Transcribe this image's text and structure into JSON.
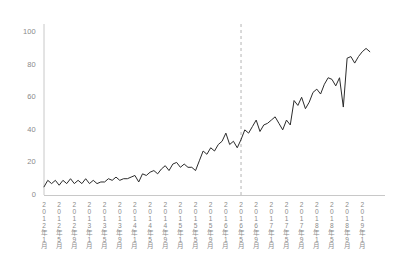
{
  "chart_data": {
    "type": "line",
    "title": "",
    "subtitle": "",
    "xlabel": "",
    "ylabel": "",
    "ylim": [
      0,
      105
    ],
    "yticks": [
      0,
      20,
      40,
      60,
      80,
      100
    ],
    "grid": false,
    "legend": null,
    "legend_position": "none",
    "line_color": "#2b2b2b",
    "axis_color": "#c8c8c8",
    "tick_label_color": "#8a8a8a",
    "annotations": [
      {
        "type": "vline",
        "label": "2016年5月",
        "x_index": 52,
        "style": "dashed",
        "color": "#b4b4b4"
      }
    ],
    "x_tick_labels": [
      "2012年1月",
      "2012年5月",
      "2012年9月",
      "2013年1月",
      "2013年5月",
      "2013年9月",
      "2014年1月",
      "2014年5月",
      "2014年9月",
      "2015年1月",
      "2015年5月",
      "2015年9月",
      "2016年1月",
      "2016年5月",
      "2016年9月",
      "2017年1月",
      "2017年5月",
      "2017年9月",
      "2018年1月",
      "2018年5月",
      "2018年9月",
      "2019年1月"
    ],
    "x_tick_index": [
      0,
      4,
      8,
      12,
      16,
      20,
      24,
      28,
      32,
      36,
      40,
      44,
      48,
      52,
      56,
      60,
      64,
      68,
      72,
      76,
      80,
      84
    ],
    "x": [
      "2012-01",
      "2012-02",
      "2012-03",
      "2012-04",
      "2012-05",
      "2012-06",
      "2012-07",
      "2012-08",
      "2012-09",
      "2012-10",
      "2012-11",
      "2012-12",
      "2013-01",
      "2013-02",
      "2013-03",
      "2013-04",
      "2013-05",
      "2013-06",
      "2013-07",
      "2013-08",
      "2013-09",
      "2013-10",
      "2013-11",
      "2013-12",
      "2014-01",
      "2014-02",
      "2014-03",
      "2014-04",
      "2014-05",
      "2014-06",
      "2014-07",
      "2014-08",
      "2014-09",
      "2014-10",
      "2014-11",
      "2014-12",
      "2015-01",
      "2015-02",
      "2015-03",
      "2015-04",
      "2015-05",
      "2015-06",
      "2015-07",
      "2015-08",
      "2015-09",
      "2015-10",
      "2015-11",
      "2015-12",
      "2016-01",
      "2016-02",
      "2016-03",
      "2016-04",
      "2016-05",
      "2016-06",
      "2016-07",
      "2016-08",
      "2016-09",
      "2016-10",
      "2016-11",
      "2016-12",
      "2017-01",
      "2017-02",
      "2017-03",
      "2017-04",
      "2017-05",
      "2017-06",
      "2017-07",
      "2017-08",
      "2017-09",
      "2017-10",
      "2017-11",
      "2017-12",
      "2018-01",
      "2018-02",
      "2018-03",
      "2018-04",
      "2018-05",
      "2018-06",
      "2018-07",
      "2018-08",
      "2018-09",
      "2018-10",
      "2018-11",
      "2018-12",
      "2019-01",
      "2019-02",
      "2019-03"
    ],
    "values": [
      5,
      9,
      7,
      9,
      6,
      9,
      7,
      10,
      7,
      9,
      7,
      10,
      7,
      9,
      7,
      8,
      8,
      10,
      9,
      11,
      9,
      10,
      10,
      11,
      12,
      8,
      13,
      12,
      14,
      15,
      13,
      16,
      18,
      15,
      19,
      20,
      17,
      19,
      17,
      17,
      15,
      21,
      27,
      25,
      29,
      27,
      31,
      33,
      38,
      31,
      33,
      29,
      34,
      40,
      38,
      42,
      46,
      39,
      43,
      44,
      46,
      48,
      44,
      40,
      46,
      43,
      58,
      55,
      60,
      53,
      57,
      63,
      65,
      62,
      68,
      72,
      71,
      67,
      72,
      54,
      84,
      85,
      81,
      85,
      88,
      90,
      88
    ],
    "series_name": "value"
  }
}
